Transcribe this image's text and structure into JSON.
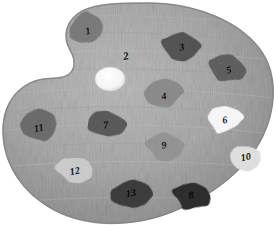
{
  "scene": {
    "title": "Artist paint palette with numbered color wells",
    "background_color": "#ffffff",
    "palette_base_color": "#a8a8a8",
    "palette_edge_color": "#8a8a8a",
    "palette_highlight_color": "#bdbdbd",
    "thumb_hole_color": "#f2f2f2",
    "label_color": "#141414"
  },
  "palette": {
    "surface_name": "palette-surface",
    "thumbhole_name": "palette-thumb-hole"
  },
  "free_labels": [
    {
      "id": "lbl2",
      "text": "2",
      "x": 126,
      "y": 57,
      "rotate": -10,
      "size": 11
    }
  ],
  "blobs": [
    {
      "id": "blob-1",
      "label": "1",
      "color": "#7d7d7d",
      "cx": 86,
      "cy": 29,
      "rx": 21,
      "ry": 16,
      "rot": -8,
      "label_x": 88,
      "label_y": 32,
      "label_rot": -14,
      "label_size": 10,
      "label_color": "#151515"
    },
    {
      "id": "blob-3",
      "label": "3",
      "color": "#565656",
      "cx": 181,
      "cy": 46,
      "rx": 20,
      "ry": 16,
      "rot": 4,
      "label_x": 182,
      "label_y": 48,
      "label_rot": -12,
      "label_size": 10,
      "label_color": "#0d0d0d"
    },
    {
      "id": "blob-5",
      "label": "5",
      "color": "#616161",
      "cx": 228,
      "cy": 69,
      "rx": 20,
      "ry": 16,
      "rot": 10,
      "label_x": 229,
      "label_y": 71,
      "label_rot": -14,
      "label_size": 10,
      "label_color": "#0d0d0d"
    },
    {
      "id": "blob-4",
      "label": "4",
      "color": "#8e8e8e",
      "cx": 164,
      "cy": 95,
      "rx": 20,
      "ry": 16,
      "rot": -4,
      "label_x": 164,
      "label_y": 97,
      "label_rot": -10,
      "label_size": 10,
      "label_color": "#121212"
    },
    {
      "id": "blob-6",
      "label": "6",
      "color": "#fbfbfb",
      "cx": 224,
      "cy": 120,
      "rx": 19,
      "ry": 15,
      "rot": -3,
      "label_x": 225,
      "label_y": 121,
      "label_rot": -12,
      "label_size": 10,
      "label_color": "#181818"
    },
    {
      "id": "blob-11",
      "label": "11",
      "color": "#6e6e6e",
      "cx": 39,
      "cy": 127,
      "rx": 20,
      "ry": 16,
      "rot": -6,
      "label_x": 39,
      "label_y": 129,
      "label_rot": -12,
      "label_size": 10,
      "label_color": "#121212"
    },
    {
      "id": "blob-7",
      "label": "7",
      "color": "#5c5c5c",
      "cx": 105,
      "cy": 124,
      "rx": 21,
      "ry": 16,
      "rot": 3,
      "label_x": 106,
      "label_y": 126,
      "label_rot": -8,
      "label_size": 10,
      "label_color": "#0d0d0d"
    },
    {
      "id": "blob-9",
      "label": "9",
      "color": "#979797",
      "cx": 164,
      "cy": 146,
      "rx": 20,
      "ry": 16,
      "rot": -2,
      "label_x": 164,
      "label_y": 146,
      "label_rot": -10,
      "label_size": 10,
      "label_color": "#141414"
    },
    {
      "id": "blob-10",
      "label": "10",
      "color": "#e3e3e3",
      "cx": 245,
      "cy": 159,
      "rx": 20,
      "ry": 15,
      "rot": 6,
      "label_x": 246,
      "label_y": 158,
      "label_rot": -12,
      "label_size": 10,
      "label_color": "#141414"
    },
    {
      "id": "blob-12",
      "label": "12",
      "color": "#cfcfcf",
      "cx": 75,
      "cy": 170,
      "rx": 20,
      "ry": 15,
      "rot": -4,
      "label_x": 75,
      "label_y": 172,
      "label_rot": -12,
      "label_size": 10,
      "label_color": "#141414"
    },
    {
      "id": "blob-13",
      "label": "13",
      "color": "#3e3e3e",
      "cx": 130,
      "cy": 195,
      "rx": 22,
      "ry": 16,
      "rot": 2,
      "label_x": 131,
      "label_y": 194,
      "label_rot": -10,
      "label_size": 10,
      "label_color": "#0a0a0a"
    },
    {
      "id": "blob-8",
      "label": "8",
      "color": "#2e2e2e",
      "cx": 192,
      "cy": 196,
      "rx": 21,
      "ry": 16,
      "rot": 4,
      "label_x": 191,
      "label_y": 196,
      "label_rot": -10,
      "label_size": 10,
      "label_color": "#080808"
    }
  ]
}
